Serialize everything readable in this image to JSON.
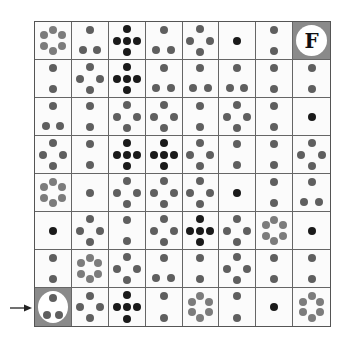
{
  "board": {
    "rows": 8,
    "cols": 8,
    "colors": {
      "gray": "#5f5f5f",
      "light": "#7c7c7c",
      "dark": "#1a1a1a",
      "special_bg": "#8a8a8a",
      "grid": "#666666"
    },
    "cells": [
      [
        {
          "pattern": "hex6",
          "tone": "light"
        },
        {
          "pattern": "tri3",
          "tone": "gray"
        },
        {
          "pattern": "plus5",
          "tone": "dark"
        },
        {
          "pattern": "tri3",
          "tone": "gray"
        },
        {
          "pattern": "diamond4",
          "tone": "gray"
        },
        {
          "pattern": "one",
          "tone": "dark"
        },
        {
          "pattern": "two",
          "tone": "gray"
        },
        {
          "pattern": "finish",
          "label": "F"
        }
      ],
      [
        {
          "pattern": "two",
          "tone": "gray"
        },
        {
          "pattern": "diamond4",
          "tone": "gray"
        },
        {
          "pattern": "plus5",
          "tone": "dark"
        },
        {
          "pattern": "tri3",
          "tone": "gray"
        },
        {
          "pattern": "tri3",
          "tone": "gray"
        },
        {
          "pattern": "tri3",
          "tone": "gray"
        },
        {
          "pattern": "two",
          "tone": "gray"
        },
        {
          "pattern": "two",
          "tone": "gray"
        }
      ],
      [
        {
          "pattern": "tri3",
          "tone": "gray"
        },
        {
          "pattern": "two",
          "tone": "gray"
        },
        {
          "pattern": "diamond4",
          "tone": "gray"
        },
        {
          "pattern": "diamond4",
          "tone": "gray"
        },
        {
          "pattern": "two",
          "tone": "gray"
        },
        {
          "pattern": "diamond4",
          "tone": "gray"
        },
        {
          "pattern": "two",
          "tone": "gray"
        },
        {
          "pattern": "one",
          "tone": "dark"
        }
      ],
      [
        {
          "pattern": "diamond4",
          "tone": "gray"
        },
        {
          "pattern": "two",
          "tone": "gray"
        },
        {
          "pattern": "plus5",
          "tone": "dark"
        },
        {
          "pattern": "plus5",
          "tone": "dark"
        },
        {
          "pattern": "diamond4",
          "tone": "gray"
        },
        {
          "pattern": "two",
          "tone": "gray"
        },
        {
          "pattern": "two",
          "tone": "gray"
        },
        {
          "pattern": "diamond4",
          "tone": "gray"
        }
      ],
      [
        {
          "pattern": "hex6",
          "tone": "light"
        },
        {
          "pattern": "one",
          "tone": "gray"
        },
        {
          "pattern": "diamond4",
          "tone": "gray"
        },
        {
          "pattern": "diamond4",
          "tone": "gray"
        },
        {
          "pattern": "diamond4",
          "tone": "gray"
        },
        {
          "pattern": "one",
          "tone": "dark"
        },
        {
          "pattern": "two",
          "tone": "gray"
        },
        {
          "pattern": "tri3",
          "tone": "gray"
        }
      ],
      [
        {
          "pattern": "one",
          "tone": "dark"
        },
        {
          "pattern": "diamond4",
          "tone": "gray"
        },
        {
          "pattern": "two",
          "tone": "gray"
        },
        {
          "pattern": "diamond4",
          "tone": "gray"
        },
        {
          "pattern": "plus5",
          "tone": "dark"
        },
        {
          "pattern": "diamond4",
          "tone": "gray"
        },
        {
          "pattern": "hex6",
          "tone": "light"
        },
        {
          "pattern": "one",
          "tone": "dark"
        }
      ],
      [
        {
          "pattern": "two",
          "tone": "gray"
        },
        {
          "pattern": "hex6",
          "tone": "light"
        },
        {
          "pattern": "diamond4",
          "tone": "gray"
        },
        {
          "pattern": "tri3",
          "tone": "gray"
        },
        {
          "pattern": "two",
          "tone": "gray"
        },
        {
          "pattern": "diamond4",
          "tone": "gray"
        },
        {
          "pattern": "two",
          "tone": "gray"
        },
        {
          "pattern": "two",
          "tone": "gray"
        }
      ],
      [
        {
          "pattern": "start",
          "inner": "tri3",
          "tone": "gray"
        },
        {
          "pattern": "diamond4",
          "tone": "gray"
        },
        {
          "pattern": "plus5",
          "tone": "dark"
        },
        {
          "pattern": "two",
          "tone": "gray"
        },
        {
          "pattern": "hex6",
          "tone": "light"
        },
        {
          "pattern": "two",
          "tone": "gray"
        },
        {
          "pattern": "one",
          "tone": "dark"
        },
        {
          "pattern": "hex6",
          "tone": "light"
        }
      ]
    ]
  },
  "start_marker": {
    "icon": "arrow-right-icon",
    "row": 8,
    "col": 1
  },
  "finish_marker": {
    "label": "F",
    "row": 1,
    "col": 8
  }
}
